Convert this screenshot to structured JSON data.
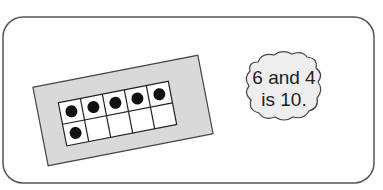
{
  "figure": {
    "ten_frame": {
      "rows": 2,
      "columns": 5,
      "filled_cells": 6,
      "empty_cells": 4,
      "top_row": [
        true,
        true,
        true,
        true,
        true
      ],
      "bottom_row": [
        true,
        false,
        false,
        false,
        false
      ]
    },
    "bubble": {
      "line1": "6 and 4",
      "line2": "is 10."
    },
    "colors": {
      "border": "#555555",
      "card_fill": "#d9d9d9",
      "counter": "#111111",
      "bubble_fill": "#eeeeee"
    }
  }
}
